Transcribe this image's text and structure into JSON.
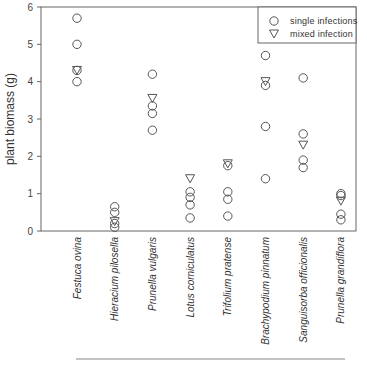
{
  "chart_data": {
    "type": "scatter",
    "title": "",
    "xlabel": "",
    "ylabel": "plant biomass (g)",
    "ylim": [
      0,
      6
    ],
    "yticks": [
      0,
      1,
      2,
      3,
      4,
      5,
      6
    ],
    "grid": false,
    "legend_position": "top-right",
    "categories": [
      "Festuca ovina",
      "Hieracium pilosella",
      "Prunella vulgaris",
      "Lotus corniculatus",
      "Trifolium pratense",
      "Brachypodium pinnatum",
      "Sanguisorba officionalis",
      "Prunella grandiflora"
    ],
    "series": [
      {
        "name": "single infections",
        "marker": "circle",
        "values": [
          [
            5.7,
            5.0,
            4.3,
            4.0
          ],
          [
            0.65,
            0.5,
            0.2,
            0.1
          ],
          [
            4.2,
            3.35,
            3.15,
            2.7
          ],
          [
            1.05,
            0.9,
            0.7,
            0.35
          ],
          [
            1.75,
            1.05,
            0.85,
            0.4
          ],
          [
            4.7,
            3.9,
            2.8,
            1.4
          ],
          [
            4.1,
            2.6,
            1.9,
            1.7
          ],
          [
            1.0,
            0.95,
            0.45,
            0.3
          ]
        ]
      },
      {
        "name": "mixed infection",
        "marker": "triangle-down",
        "values": [
          4.3,
          0.25,
          3.55,
          1.4,
          1.8,
          4.0,
          2.3,
          0.8
        ]
      }
    ]
  },
  "legend": {
    "items": [
      {
        "label": "single infections",
        "marker": "circle"
      },
      {
        "label": "mixed infection",
        "marker": "triangle-down"
      }
    ]
  },
  "colors": {
    "axis": "#555555",
    "marker_stroke": "#555555",
    "text": "#333333"
  }
}
